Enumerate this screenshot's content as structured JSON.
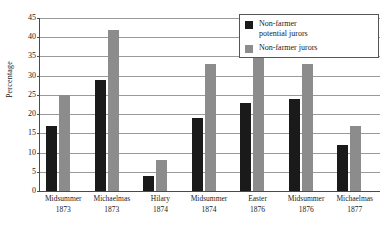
{
  "chart_data": {
    "type": "bar",
    "title": "",
    "subtitle": "",
    "xlabel": "",
    "ylabel": "Percentage",
    "ylim": [
      0,
      45
    ],
    "ytick_step": 5,
    "yticks": [
      0,
      5,
      10,
      15,
      20,
      25,
      30,
      35,
      40,
      45
    ],
    "grid": true,
    "grid_axis": "y",
    "legend_position": "upper right",
    "categories": [
      "Midsummer 1873",
      "Michaelmas 1873",
      "Hilary 1874",
      "Midsummer 1874",
      "Easter 1876",
      "Midsummer 1876",
      "Michaelmas 1877"
    ],
    "category_lines": [
      {
        "term": "Midsummer",
        "year": "1873"
      },
      {
        "term": "Michaelmas",
        "year": "1873"
      },
      {
        "term": "Hilary",
        "year": "1874"
      },
      {
        "term": "Midsummer",
        "year": "1874"
      },
      {
        "term": "Easter",
        "year": "1876"
      },
      {
        "term": "Midsummer",
        "year": "1876"
      },
      {
        "term": "Michaelmas",
        "year": "1877"
      }
    ],
    "series": [
      {
        "name": "Non-farmer potential jurors",
        "color": "#1a1a1a",
        "values": [
          17,
          29,
          4,
          19,
          23,
          24,
          12
        ]
      },
      {
        "name": "Non-farmer jurors",
        "color": "#8c8c8c",
        "values": [
          25,
          42,
          8,
          33,
          42,
          33,
          17
        ]
      }
    ]
  },
  "legend": {
    "entries": [
      {
        "label_line1": "Non-farmer",
        "label_line2": "potential jurors",
        "color": "#1a1a1a"
      },
      {
        "label_line1": "Non-farmer jurors",
        "label_line2": "",
        "color": "#8c8c8c"
      }
    ]
  },
  "colors": {
    "series_black": "#1a1a1a",
    "series_gray": "#8c8c8c",
    "gridline": "#9a9a9a",
    "axis": "#4a4a4a",
    "background": "#ffffff"
  }
}
